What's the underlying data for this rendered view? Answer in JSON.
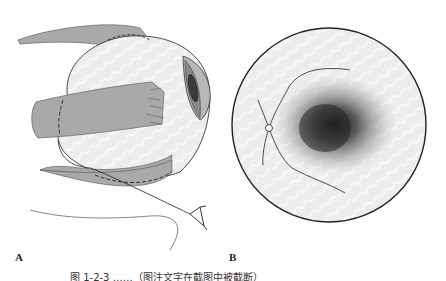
{
  "figure": {
    "panels": [
      {
        "label": "A",
        "description": "Lateral view of eyeball with extraocular muscles and optic nerve"
      },
      {
        "label": "B",
        "description": "Fundus view with optic disc, retinal vessels and dark macular lesion"
      }
    ],
    "caption": "图 1-2-3  ……（图注文字在截图中被截断）"
  },
  "colors": {
    "muscle": "#a9a9a9",
    "eyeball": "#ebebeb",
    "outline": "#222222",
    "iris": "#8a8a8a",
    "pupil": "#3a3a3a",
    "fundus_bg": "#ededed",
    "lesion": "#1a1a1a"
  }
}
